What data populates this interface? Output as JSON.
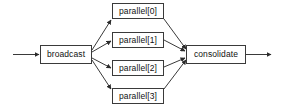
{
  "diagram": {
    "type": "flow-graph",
    "orientation": "left-to-right",
    "background_color": "#ffffff",
    "node_fill_color": "#ffffff",
    "node_border_color": "#3a3a3a",
    "edge_color": "#3a3a3a",
    "text_color": "#111111",
    "nodes": [
      {
        "id": "broadcast",
        "label": "broadcast",
        "role": "fan-out"
      },
      {
        "id": "parallel0",
        "label": "parallel[0]",
        "role": "worker"
      },
      {
        "id": "parallel1",
        "label": "parallel[1]",
        "role": "worker"
      },
      {
        "id": "parallel2",
        "label": "parallel[2]",
        "role": "worker"
      },
      {
        "id": "parallel3",
        "label": "parallel[3]",
        "role": "worker"
      },
      {
        "id": "consolidate",
        "label": "consolidate",
        "role": "fan-in"
      }
    ],
    "edges": [
      {
        "from": "input",
        "to": "broadcast"
      },
      {
        "from": "broadcast",
        "to": "parallel0"
      },
      {
        "from": "broadcast",
        "to": "parallel1"
      },
      {
        "from": "broadcast",
        "to": "parallel2"
      },
      {
        "from": "broadcast",
        "to": "parallel3"
      },
      {
        "from": "parallel0",
        "to": "consolidate"
      },
      {
        "from": "parallel1",
        "to": "consolidate"
      },
      {
        "from": "parallel2",
        "to": "consolidate"
      },
      {
        "from": "parallel3",
        "to": "consolidate"
      },
      {
        "from": "consolidate",
        "to": "output"
      }
    ]
  }
}
